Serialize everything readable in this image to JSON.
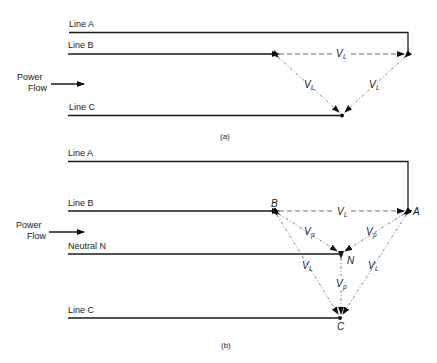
{
  "diagram_a": {
    "caption": "(a)",
    "lines": [
      {
        "label": "Line A"
      },
      {
        "label": "Line B"
      },
      {
        "label": "Line C"
      }
    ],
    "power_flow": {
      "line1": "Power",
      "line2": "Flow"
    },
    "vectors": [
      {
        "label": "V",
        "sub": "L",
        "from": "B",
        "to": "A"
      },
      {
        "label": "V",
        "sub": "L",
        "from": "B",
        "to": "C"
      },
      {
        "label": "V",
        "sub": "L",
        "from": "A",
        "to": "C"
      }
    ]
  },
  "diagram_b": {
    "caption": "(b)",
    "lines": [
      {
        "label": "Line A"
      },
      {
        "label": "Line B"
      },
      {
        "label": "Neutral N"
      },
      {
        "label": "Line C"
      }
    ],
    "power_flow": {
      "line1": "Power",
      "line2": "Flow"
    },
    "points": {
      "A": "A",
      "B": "B",
      "C": "C",
      "N": "N"
    },
    "vectors": [
      {
        "label": "V",
        "sub": "L",
        "from": "B",
        "to": "A"
      },
      {
        "label": "V",
        "sub": "p",
        "from": "B",
        "to": "N"
      },
      {
        "label": "V",
        "sub": "p",
        "from": "A",
        "to": "N"
      },
      {
        "label": "V",
        "sub": "p",
        "from": "N",
        "to": "C"
      },
      {
        "label": "V",
        "sub": "L",
        "from": "B",
        "to": "C"
      },
      {
        "label": "V",
        "sub": "L",
        "from": "A",
        "to": "C"
      }
    ]
  }
}
